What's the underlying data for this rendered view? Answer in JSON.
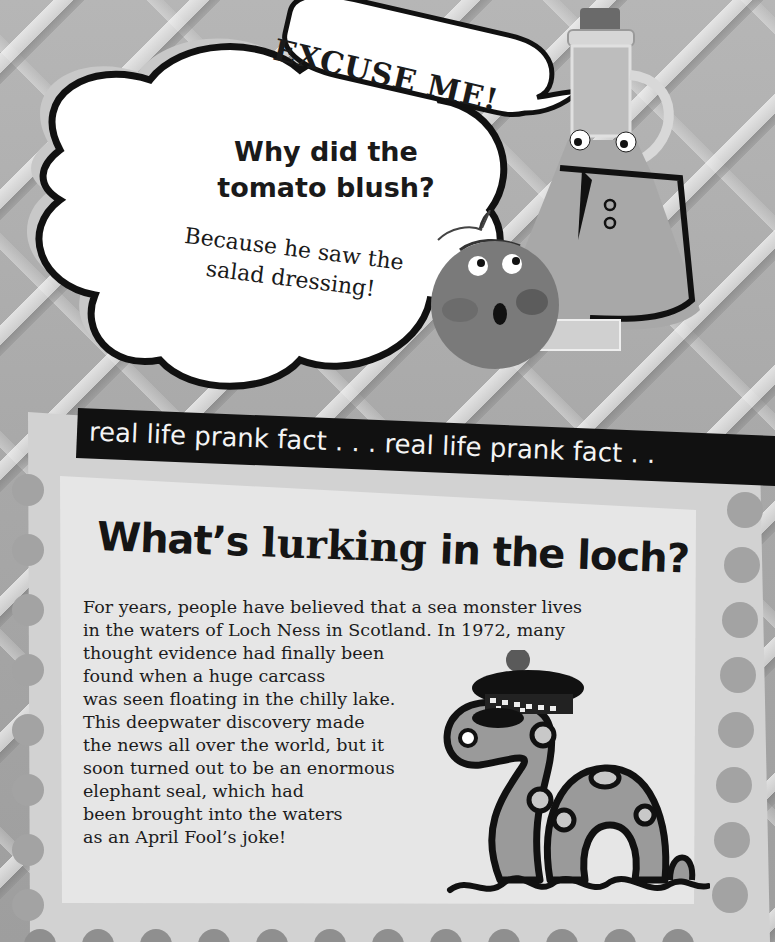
{
  "joke": {
    "speech_bubble": "EXCUSE ME!",
    "question": "Why did the tomato blush?",
    "question_lines": [
      "Why did the",
      "tomato blush?"
    ],
    "answer_lines": [
      "Because he saw the",
      "salad dressing!"
    ]
  },
  "fact": {
    "banner": "real life prank fact . . . real life prank fact . .",
    "title_prefix": "What’s",
    "title_emphasis": "lurking",
    "title_suffix": "in the loch?",
    "body_lines": [
      "For years, people have believed that a sea monster lives",
      "in the waters of Loch Ness in Scotland. In 1972, many",
      "thought evidence had finally been",
      "found when a huge carcass",
      "was seen floating in the chilly lake.",
      "This deepwater discovery made",
      "the news all over the world, but it",
      "soon turned out to be an enormous",
      "elephant seal, which had",
      "been brought into the waters",
      "as an April Fool’s joke!"
    ]
  },
  "illustrations": {
    "oil_bottle": "salad-dressing-bottle-character",
    "tomato": "blushing-tomato-character",
    "monster": "loch-ness-monster-with-tartan-cap"
  },
  "colors": {
    "ink": "#111111",
    "paper": "#e6e6e6",
    "stamp": "#d4d4d4",
    "bubble": "#ffffff",
    "banner_bg": "#111111",
    "banner_text": "#f4f4f4"
  }
}
